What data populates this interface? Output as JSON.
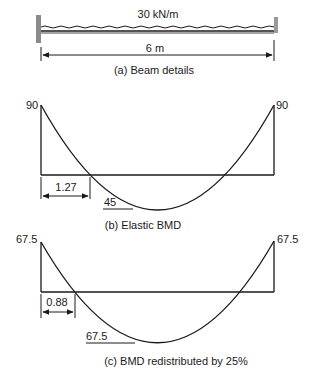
{
  "beam": {
    "load_label": "30 kN/m",
    "span_label": "6 m",
    "caption": "(a) Beam details"
  },
  "elastic_bmd": {
    "left_moment": "90",
    "right_moment": "90",
    "contraflexure_distance": "1.27",
    "midspan_moment": "45",
    "caption": "(b) Elastic BMD"
  },
  "redistributed_bmd": {
    "left_moment": "67.5",
    "right_moment": "67.5",
    "contraflexure_distance": "0.88",
    "midspan_moment": "67.5",
    "caption": "(c) BMD redistributed by 25%"
  },
  "colors": {
    "ink": "#1a1a1a",
    "support_hatch": "#888888",
    "background": "#ffffff"
  }
}
